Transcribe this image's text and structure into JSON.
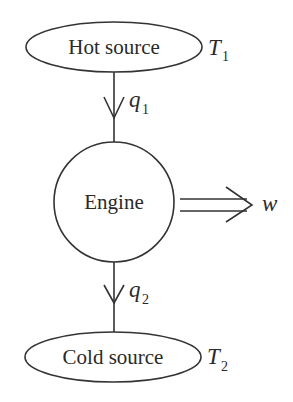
{
  "diagram": {
    "type": "heat-engine schematic",
    "nodes": [
      {
        "id": "hot",
        "label": "Hot source",
        "shape": "ellipse",
        "temperature": {
          "symbol": "T",
          "subscript": "1"
        }
      },
      {
        "id": "engine",
        "label": "Engine",
        "shape": "circle"
      },
      {
        "id": "cold",
        "label": "Cold source",
        "shape": "ellipse",
        "temperature": {
          "symbol": "T",
          "subscript": "2"
        }
      }
    ],
    "edges": [
      {
        "from": "hot",
        "to": "engine",
        "label": {
          "symbol": "q",
          "subscript": "1"
        },
        "style": "single-arrow"
      },
      {
        "from": "engine",
        "to": "cold",
        "label": {
          "symbol": "q",
          "subscript": "2"
        },
        "style": "single-arrow"
      },
      {
        "from": "engine",
        "to": "output",
        "label": {
          "symbol": "w",
          "subscript": ""
        },
        "style": "double-arrow"
      }
    ]
  },
  "colors": {
    "stroke": "#333333",
    "text": "#2a2a2a",
    "background": "#ffffff"
  }
}
